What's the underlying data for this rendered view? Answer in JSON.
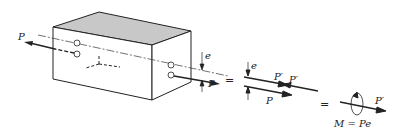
{
  "diagram": {
    "colors": {
      "stroke": "#222222",
      "top_face": "#c8c8c8",
      "background": "#ffffff"
    },
    "labels": {
      "load_left": "P",
      "eccentricity_1": "e",
      "load_right": "P",
      "equals_1": "=",
      "eccentricity_2": "e",
      "p_prime_1": "P′",
      "p_prime_2": "P′",
      "p_lower": "P",
      "equals_2": "=",
      "p_prime_final": "P′",
      "moment": "M = Pe"
    }
  }
}
